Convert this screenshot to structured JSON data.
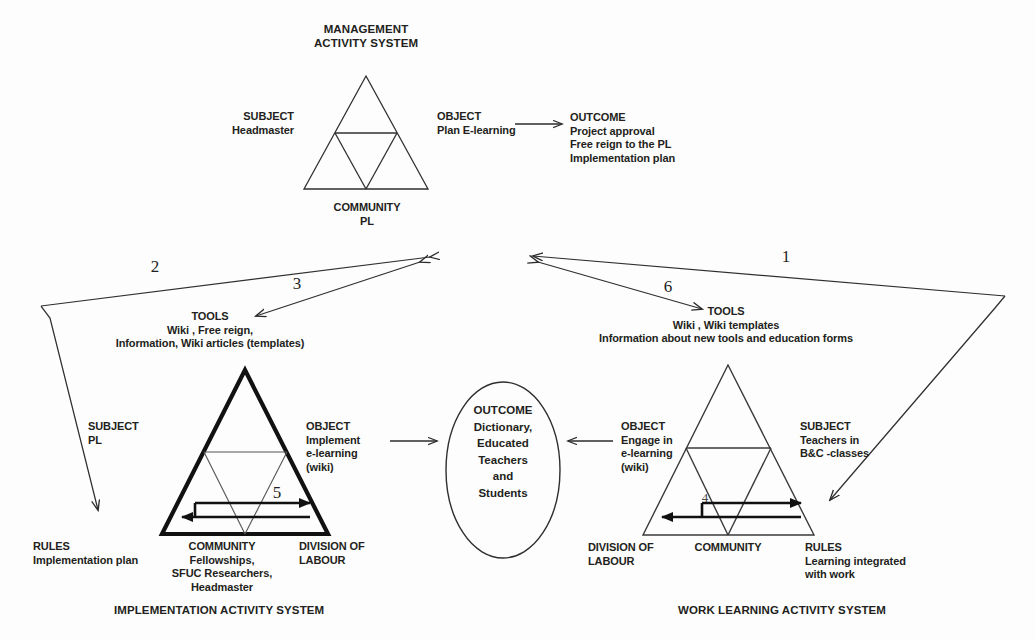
{
  "figure": {
    "top_system": {
      "title_line1": "MANAGEMENT",
      "title_line2": "ACTIVITY SYSTEM",
      "subject_label": "SUBJECT",
      "subject_value": "Headmaster",
      "object_label": "OBJECT",
      "object_value": "Plan E-learning",
      "community_label": "COMMUNITY",
      "community_value": "PL",
      "outcome_label": "OUTCOME",
      "outcome_lines": [
        "Project approval",
        "Free reign to the PL",
        "Implementation plan"
      ]
    },
    "left_system": {
      "caption": "IMPLEMENTATION ACTIVITY SYSTEM",
      "tools_label": "TOOLS",
      "tools_line1": "Wiki , Free reign,",
      "tools_line2": "Information, Wiki articles (templates)",
      "subject_label": "SUBJECT",
      "subject_value": "PL",
      "object_label": "OBJECT",
      "object_line1": "Implement",
      "object_line2": "e-learning",
      "object_line3": "(wiki)",
      "rules_label": "RULES",
      "rules_value": "Implementation plan",
      "community_label": "COMMUNITY",
      "community_line1": "Fellowships,",
      "community_line2": "SFUC Researchers,",
      "community_line3": "Headmaster",
      "division_label_line1": "DIVISION OF",
      "division_label_line2": "LABOUR"
    },
    "right_system": {
      "caption": "WORK LEARNING ACTIVITY SYSTEM",
      "tools_label": "TOOLS",
      "tools_line1": "Wiki , Wiki templates",
      "tools_line2": "Information about new tools and education forms",
      "subject_label": "SUBJECT",
      "subject_line1": "Teachers in",
      "subject_line2": "B&C -classes",
      "object_label": "OBJECT",
      "object_line1": "Engage in",
      "object_line2": "e-learning",
      "object_line3": "(wiki)",
      "rules_label": "RULES",
      "rules_line1": "Learning integrated",
      "rules_line2": "with work",
      "community_label": "COMMUNITY",
      "division_label_line1": "DIVISION OF",
      "division_label_line2": "LABOUR"
    },
    "center_outcome": {
      "label": "OUTCOME",
      "lines": [
        "Dictionary,",
        "Educated",
        "Teachers",
        "and",
        "Students"
      ]
    },
    "contradiction_numbers": {
      "one": "1",
      "two": "2",
      "three": "3",
      "four": "4",
      "five": "5",
      "six": "6"
    },
    "colors": {
      "ink": "#231f20",
      "line": "#3a3a3a",
      "background": "#fdfdfd"
    }
  }
}
